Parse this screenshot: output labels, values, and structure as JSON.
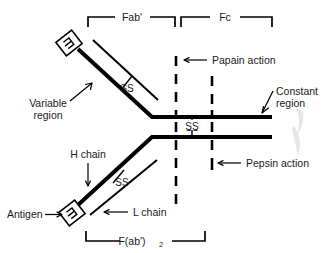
{
  "figure": {
    "background_color": "#ffffff",
    "line_color": "#000000",
    "text_color": "#1a1a1a",
    "width": 323,
    "height": 253
  },
  "brackets": {
    "fab": {
      "label": "Fab'",
      "position": "top-left"
    },
    "fc": {
      "label": "Fc",
      "position": "top-right"
    },
    "fab2": {
      "label": "F(ab')",
      "subscript": "2",
      "position": "bottom"
    }
  },
  "labels": {
    "variable_region": {
      "line1": "Variable",
      "line2": "region"
    },
    "constant_region": {
      "line1": "Constant",
      "line2": "region"
    },
    "papain_action": "Papain action",
    "pepsin_action": "Pepsin action",
    "h_chain": "H chain",
    "l_chain": "L chain",
    "antigen": "Antigen",
    "ss_upper": "SS",
    "ss_center": "SS",
    "ss_lower": "SS"
  },
  "elements": {
    "antigen_box_top": "antigen-binding-site-top",
    "antigen_box_bottom": "antigen-binding-site-bottom",
    "papain_cleavage_line": "dashed-vertical-papain",
    "pepsin_cleavage_line": "dashed-vertical-pepsin"
  },
  "arrows": {
    "antigen_arrow": "→",
    "papain_arrow": "←",
    "pepsin_arrow": "←"
  }
}
